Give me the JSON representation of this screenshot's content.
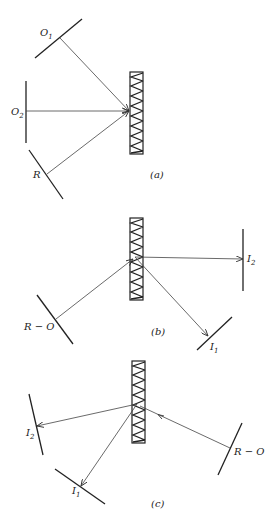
{
  "figure": {
    "panels": [
      {
        "id": "a",
        "caption": "(a)",
        "labels": {
          "o1": "O",
          "o1_sub": "1",
          "o2": "O",
          "o2_sub": "2",
          "r": "R"
        }
      },
      {
        "id": "b",
        "caption": "(b)",
        "labels": {
          "ro": "R − O",
          "i1": "I",
          "i1_sub": "1",
          "i2": "I",
          "i2_sub": "2"
        }
      },
      {
        "id": "c",
        "caption": "(c)",
        "labels": {
          "ro": "R − O",
          "i1": "I",
          "i1_sub": "1",
          "i2": "I",
          "i2_sub": "2"
        }
      }
    ],
    "colors": {
      "line": "#222222",
      "ray": "#444444",
      "background": "#ffffff"
    }
  }
}
